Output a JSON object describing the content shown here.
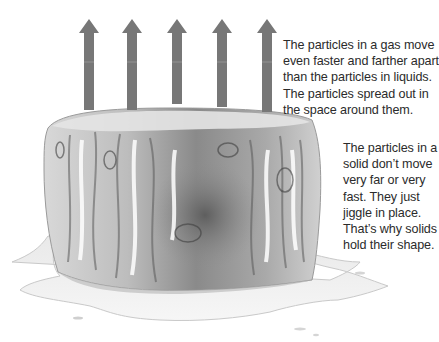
{
  "diagram": {
    "arrow_color": "#777777",
    "arrow_count": 5,
    "arrows": [
      {
        "tip_x": 89,
        "tip_y": 19,
        "bottom_y": 109
      },
      {
        "tip_x": 132,
        "tip_y": 19,
        "bottom_y": 109
      },
      {
        "tip_x": 177,
        "tip_y": 19,
        "bottom_y": 103
      },
      {
        "tip_x": 222,
        "tip_y": 19,
        "bottom_y": 106
      },
      {
        "tip_x": 267,
        "tip_y": 19,
        "bottom_y": 111
      }
    ]
  },
  "captions": {
    "gas": {
      "lines": [
        "The particles in a gas move",
        "even faster and farther apart",
        "than the particles in liquids.",
        "The particles spread out in",
        "the space around them."
      ]
    },
    "solid": {
      "lines": [
        "The particles in a",
        "solid don’t move",
        "very far or very",
        "fast. They just",
        "jiggle in place.",
        "That’s why solids",
        "hold their shape."
      ]
    }
  }
}
